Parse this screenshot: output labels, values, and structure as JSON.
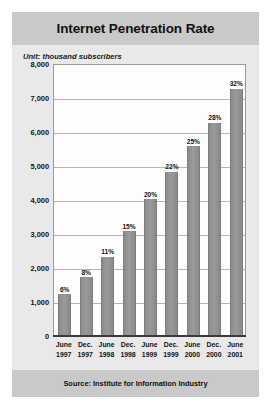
{
  "title": "Internet Penetration Rate",
  "unit_label": "Unit: thousand subscribers",
  "source": "Source: Institute for Information Industry",
  "chart_data": {
    "type": "bar",
    "title": "Internet Penetration Rate",
    "subtitle": "Unit: thousand subscribers",
    "xlabel": "",
    "ylabel": "thousand subscribers",
    "ylim": [
      0,
      8000
    ],
    "ytick_labels": [
      "8,000",
      "7,000",
      "6,000",
      "5,000",
      "4,000",
      "3,000",
      "2,000",
      "1,000",
      "0"
    ],
    "ytick_values": [
      8000,
      7000,
      6000,
      5000,
      4000,
      3000,
      2000,
      1000,
      0
    ],
    "grid": true,
    "legend": "none",
    "categories": [
      "June 1997",
      "Dec. 1997",
      "June 1998",
      "Dec. 1998",
      "June 1999",
      "Dec. 1999",
      "June 2000",
      "Dec. 2000",
      "June 2001"
    ],
    "category_lines": [
      [
        "June",
        "1997"
      ],
      [
        "Dec.",
        "1997"
      ],
      [
        "June",
        "1998"
      ],
      [
        "Dec.",
        "1998"
      ],
      [
        "June",
        "1999"
      ],
      [
        "Dec.",
        "1999"
      ],
      [
        "June",
        "2000"
      ],
      [
        "Dec.",
        "2000"
      ],
      [
        "June",
        "2001"
      ]
    ],
    "values": [
      1200,
      1700,
      2300,
      3050,
      4000,
      4800,
      5550,
      6250,
      7250
    ],
    "data_labels": [
      "6%",
      "8%",
      "11%",
      "15%",
      "20%",
      "22%",
      "25%",
      "28%",
      "32%"
    ],
    "penetration_percent": [
      6,
      8,
      11,
      15,
      20,
      22,
      25,
      28,
      32
    ],
    "bar_color": "#8f8f8f",
    "plot_background": "#fdfdfd",
    "panel_background": "#e9e9e9",
    "band_background": "#c9c9c9",
    "gridline_color": "#b4b4b4"
  }
}
